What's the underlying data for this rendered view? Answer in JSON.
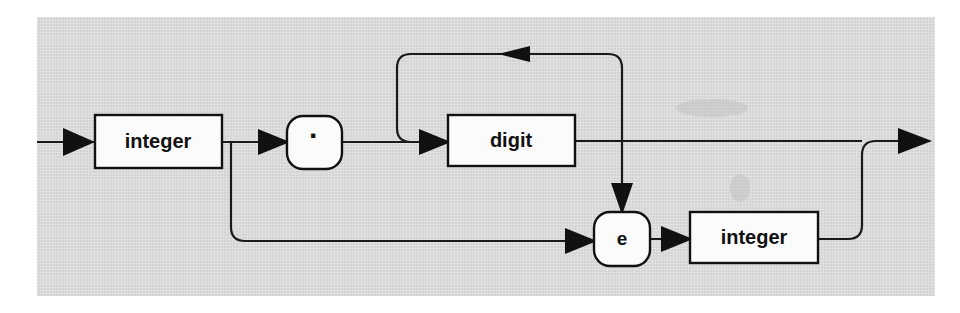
{
  "diagram": {
    "kind": "railroad-syntax-diagram",
    "panel_color": "#d4d4d4",
    "ink_color": "#111111",
    "node_fill": "#fbfbfb",
    "nodes": [
      {
        "id": "integer-left",
        "label": "integer",
        "shape": "rect",
        "name": "nonterminal-integer-left"
      },
      {
        "id": "period",
        "label": "·",
        "shape": "bubble",
        "name": "terminal-period"
      },
      {
        "id": "digit",
        "label": "digit",
        "shape": "rect",
        "name": "nonterminal-digit"
      },
      {
        "id": "exponent-e",
        "label": "e",
        "shape": "bubble",
        "name": "terminal-e"
      },
      {
        "id": "integer-right",
        "label": "integer",
        "shape": "rect",
        "name": "nonterminal-integer-right"
      }
    ],
    "paths": [
      {
        "id": "entry",
        "label": "entry-rail"
      },
      {
        "id": "main",
        "label": "main-rail"
      },
      {
        "id": "digit-loop",
        "label": "digit-repeat-loop"
      },
      {
        "id": "fraction-bypass",
        "label": "fraction-bypass-rail"
      },
      {
        "id": "exponent-branch",
        "label": "exponent-branch-rail"
      },
      {
        "id": "exponent-rejoin",
        "label": "exponent-rejoin-rail"
      },
      {
        "id": "exit",
        "label": "exit-rail"
      }
    ],
    "arrow_count": 8
  }
}
